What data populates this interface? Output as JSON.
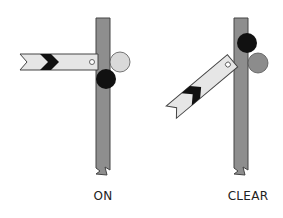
{
  "diagram": {
    "signals": [
      {
        "state": "ON",
        "label": "ON",
        "arm_angle_deg": 0,
        "upper_light_color": "#d9d9d9",
        "lower_light_color": "#111111"
      },
      {
        "state": "CLEAR",
        "label": "CLEAR",
        "arm_angle_deg": -40,
        "upper_light_color": "#111111",
        "lower_light_color": "#8c8c8c"
      }
    ],
    "colors": {
      "post": "#8e8e8e",
      "post_outline": "#444444",
      "arm": "#e6e6e6",
      "chevron": "#111111",
      "background": "#ffffff"
    }
  }
}
